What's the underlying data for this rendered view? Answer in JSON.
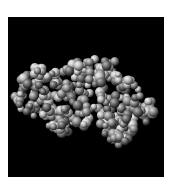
{
  "image": {
    "subject": "space-filling molecular model of a protein",
    "background_color": "#000000",
    "page_color": "#ffffff",
    "palette": [
      "#4a4a4a",
      "#7a7a7a",
      "#a0a0a0",
      "#c8c8c8",
      "#e6e6e6"
    ]
  }
}
